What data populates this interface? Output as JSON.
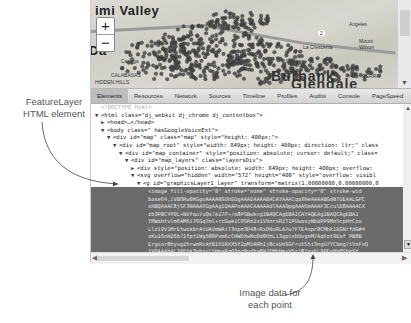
{
  "annotations": {
    "left_line1": "FeatureLayer",
    "left_line2": "HTML element",
    "bottom_line1": "Image data for",
    "bottom_line2": "each point"
  },
  "map": {
    "labels": {
      "simi_valley": "imi Valley",
      "calabasas": "CALABASAS",
      "hidden_hills": "HIDDEN HILLS",
      "daly": "Da",
      "canoga": "Canoga",
      "burbank": "Burbank",
      "glendale": "Glendale",
      "la_crescenta": "La Crescenta",
      "montrose": "Montrose",
      "mount_wilson": "Mount Wilson",
      "angeles": "Angeles",
      "sierra": "SIERRA",
      "route_2": "2"
    },
    "zoom_in_label": "+",
    "zoom_out_label": "−",
    "point_color": "#4a4a4a"
  },
  "devtools": {
    "tabs": [
      {
        "label": "Elements",
        "active": true
      },
      {
        "label": "Resources",
        "active": false
      },
      {
        "label": "Network",
        "active": false
      },
      {
        "label": "Sources",
        "active": false
      },
      {
        "label": "Timeline",
        "active": false
      },
      {
        "label": "Profiles",
        "active": false
      },
      {
        "label": "Audits",
        "active": false
      },
      {
        "label": "Console",
        "active": false
      },
      {
        "label": "PageSpeed",
        "active": false
      }
    ],
    "dom_lines": [
      {
        "indent": 0,
        "toggle": "",
        "text": "<!DOCTYPE html>",
        "doctype": true
      },
      {
        "indent": 0,
        "toggle": "▼",
        "text": "<html class=\"dj_webkit dj_chrome dj_contentbox\">"
      },
      {
        "indent": 1,
        "toggle": "▶",
        "text": "<head>…</head>"
      },
      {
        "indent": 1,
        "toggle": "▼",
        "text": "<body class=\" hasGoogleVoiceExt\">"
      },
      {
        "indent": 2,
        "toggle": "▼",
        "text": "<div id=\"map\" class=\"map\" style=\"height: 400px;\">"
      },
      {
        "indent": 3,
        "toggle": "▼",
        "text": "<div id=\"map_root\" style=\"width: 849px; height: 400px; direction: ltr;\" class"
      },
      {
        "indent": 4,
        "toggle": "▼",
        "text": "<div id=\"map_container\" style=\"position: absolute; cursor: default;\" class="
      },
      {
        "indent": 5,
        "toggle": "▼",
        "text": "<div id=\"map_layers\" class=\"layersDiv\">"
      },
      {
        "indent": 6,
        "toggle": "▶",
        "text": "<div style=\"position: absolute; width: 849px; height: 400px; overflow: "
      },
      {
        "indent": 6,
        "toggle": "▼",
        "text": "<svg overflow=\"hidden\" width=\"572\" height=\"400\" style=\"overflow: visibl"
      },
      {
        "indent": 7,
        "toggle": "▼",
        "text": "<g id=\"graphicsLayer1_layer\" transform=\"matrix(1.00000000,0.00000000,0"
      }
    ],
    "selected_lines": [
      "<image fill-opacity=\"0\" stroke=\"none\" stroke-opacity=\"0\" stroke-wid",
      "base64,iVBORw0KGgoAAAANSUhEUgAAAEAAAABACAYAAACqaXHeAAAABGdBTUEAALGPC",
      "xHBQAAAC8jSF3NAAA6GgAAgIQAAPoAAACAAAAAdTAAAOpgAAA6mAAAF3CculE8AAAACX",
      "zb3PBCYPDL+NUfau7uQs7eZ7P+/a8PSBwkcgIBAQCAgEBAICAYAQEAgIBAQCAgEBAI",
      "YMWahtvlm6AMSiT6GqTml+rcGwe1COSRn2s1VVnrxRZTIPUwovyNbUPP9Mn5cpHtCzu",
      "Llz19V1MrEtwokbrAtUAVmWAiT3npn3D48+RxDRuRLA7w7FTE4opr0CMbk1EGNrfdG#4",
      "sKu16oHZ6b7IfptIWg500PvmKcCHWDXwMuDd0OhL13gpisbUvgnM7AqFot9Eaf PB0B",
      "Ergxor8hyugZhrwnRxAtBIXIRXX5Y2pM1RRhIj8cxUnSGFrutS5i3ngU7YCbmg7iVnFvQ",
      "IVQAAAb4L2PEbk3ghoyl5HmaRqQ3qrBvdhaBWZEMhNm+VSr18TvxFL9PEsBb0ShkSY"
    ],
    "code_scroll_up": "▲",
    "code_scroll_down": "▼",
    "hscroll_left": "◀",
    "hscroll_right": "▶"
  },
  "colors": {
    "selection_bg": "#6b6b6b",
    "tab_bar": "#d9d9d9"
  }
}
